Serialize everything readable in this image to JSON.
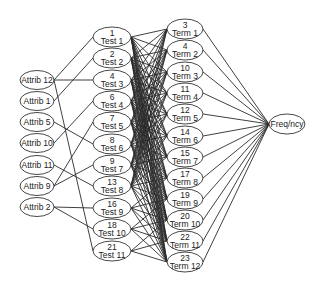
{
  "diagram": {
    "type": "layered-network",
    "colors": {
      "background": "#ffffff",
      "stroke": "#2a2a2a",
      "node_fill": "#ffffff",
      "text": "#222222"
    },
    "layers": {
      "attributes": [
        {
          "id": "A12",
          "label": "Attrib 12",
          "x": 37,
          "y": 80
        },
        {
          "id": "A1",
          "label": "Attrib 1",
          "x": 37,
          "y": 101
        },
        {
          "id": "A5",
          "label": "Attrib 5",
          "x": 37,
          "y": 122
        },
        {
          "id": "A10",
          "label": "Attrib 10",
          "x": 37,
          "y": 143
        },
        {
          "id": "A11",
          "label": "Attrib 11",
          "x": 37,
          "y": 165
        },
        {
          "id": "A9",
          "label": "Attrib 9",
          "x": 37,
          "y": 186
        },
        {
          "id": "A2",
          "label": "Attrib 2",
          "x": 37,
          "y": 207
        }
      ],
      "tests": [
        {
          "id": "T1",
          "number": "1",
          "label": "Test 1",
          "x": 112,
          "y": 37
        },
        {
          "id": "T2",
          "number": "2",
          "label": "Test 2",
          "x": 112,
          "y": 58
        },
        {
          "id": "T3",
          "number": "4",
          "label": "Test 3",
          "x": 112,
          "y": 80
        },
        {
          "id": "T4",
          "number": "6",
          "label": "Test 4",
          "x": 112,
          "y": 101
        },
        {
          "id": "T5",
          "number": "7",
          "label": "Test 5",
          "x": 112,
          "y": 122
        },
        {
          "id": "T6",
          "number": "8",
          "label": "Test 6",
          "x": 112,
          "y": 144
        },
        {
          "id": "T7",
          "number": "9",
          "label": "Test 7",
          "x": 112,
          "y": 165
        },
        {
          "id": "T8",
          "number": "13",
          "label": "Test 8",
          "x": 112,
          "y": 186
        },
        {
          "id": "T9",
          "number": "16",
          "label": "Test 9",
          "x": 112,
          "y": 208
        },
        {
          "id": "T10",
          "number": "18",
          "label": "Test 10",
          "x": 112,
          "y": 229
        },
        {
          "id": "T11",
          "number": "21",
          "label": "Test 11",
          "x": 112,
          "y": 251
        }
      ],
      "terms": [
        {
          "id": "M1",
          "number": "3",
          "label": "Term 1",
          "x": 185,
          "y": 29
        },
        {
          "id": "M2",
          "number": "4",
          "label": "Term 2",
          "x": 185,
          "y": 50
        },
        {
          "id": "M3",
          "number": "10",
          "label": "Term 3",
          "x": 185,
          "y": 72
        },
        {
          "id": "M4",
          "number": "11",
          "label": "Term 4",
          "x": 185,
          "y": 93
        },
        {
          "id": "M5",
          "number": "12",
          "label": "Term 5",
          "x": 185,
          "y": 114
        },
        {
          "id": "M6",
          "number": "14",
          "label": "Term 6",
          "x": 185,
          "y": 136
        },
        {
          "id": "M7",
          "number": "15",
          "label": "Term 7",
          "x": 185,
          "y": 157
        },
        {
          "id": "M8",
          "number": "17",
          "label": "Term 8",
          "x": 185,
          "y": 178
        },
        {
          "id": "M9",
          "number": "19",
          "label": "Term 9",
          "x": 185,
          "y": 199
        },
        {
          "id": "M10",
          "number": "20",
          "label": "Term 10",
          "x": 185,
          "y": 220
        },
        {
          "id": "M11",
          "number": "22",
          "label": "Term 11",
          "x": 185,
          "y": 241
        },
        {
          "id": "M12",
          "number": "23",
          "label": "Term 12",
          "x": 185,
          "y": 262
        }
      ],
      "output": {
        "id": "F",
        "label": "Freq/ncy",
        "x": 287,
        "y": 124
      }
    },
    "edges_attr_test": [
      [
        "A12",
        "T1"
      ],
      [
        "A12",
        "T3"
      ],
      [
        "A12",
        "T11"
      ],
      [
        "A1",
        "T2"
      ],
      [
        "A5",
        "T6"
      ],
      [
        "A10",
        "T4"
      ],
      [
        "A11",
        "T8"
      ],
      [
        "A9",
        "T5"
      ],
      [
        "A9",
        "T7"
      ],
      [
        "A2",
        "T9"
      ],
      [
        "A2",
        "T10"
      ]
    ],
    "edges_test_term_note": "Tests 1-8 connect densely to all terms; Tests 9-11 connect to lower terms",
    "edges_test_term_extra": [
      [
        "T9",
        "M8"
      ],
      [
        "T9",
        "M9"
      ],
      [
        "T9",
        "M10"
      ],
      [
        "T9",
        "M11"
      ],
      [
        "T9",
        "M12"
      ],
      [
        "T10",
        "M9"
      ],
      [
        "T10",
        "M10"
      ],
      [
        "T10",
        "M11"
      ],
      [
        "T10",
        "M12"
      ],
      [
        "T11",
        "M10"
      ],
      [
        "T11",
        "M11"
      ],
      [
        "T11",
        "M12"
      ]
    ],
    "dense_tests": [
      "T1",
      "T2",
      "T3",
      "T4",
      "T5",
      "T6",
      "T7",
      "T8"
    ]
  }
}
